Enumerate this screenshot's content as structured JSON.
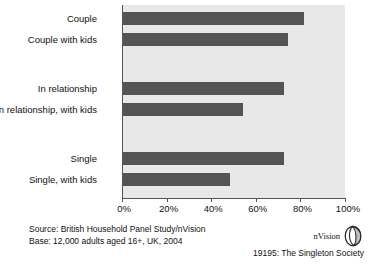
{
  "chart_data": {
    "type": "bar",
    "orientation": "horizontal",
    "title": "",
    "subtitle": "",
    "xlabel": "",
    "ylabel": "",
    "xlim": [
      0,
      100
    ],
    "grid": false,
    "legend": false,
    "categories": [
      "Couple",
      "Couple with kids",
      "In relationship",
      "In relationship, with kids",
      "Single",
      "Single, with kids"
    ],
    "values": [
      81,
      74,
      72,
      54,
      72,
      48
    ],
    "value_unit": "%",
    "xticks": [
      0,
      20,
      40,
      60,
      80,
      100
    ],
    "xticklabels": [
      "0%",
      "20%",
      "40%",
      "60%",
      "80%",
      "100%"
    ],
    "bar_color": "#545454",
    "plot_background": "#e8e8e8",
    "group_gaps_after": [
      2,
      4
    ]
  },
  "footer": {
    "source_line": "Source: British Household Panel Study/nVision",
    "base_line": "Base: 12,000 adults aged 16+, UK, 2004"
  },
  "branding": {
    "logo_text": "nVision",
    "logo_icon": "sphere-icon",
    "credit": "19195: The Singleton Society"
  }
}
